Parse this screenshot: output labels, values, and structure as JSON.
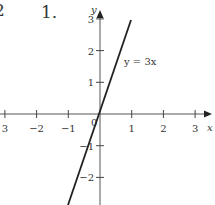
{
  "header": {
    "previous_problem_number": "2",
    "problem_number": "1."
  },
  "chart_data": {
    "type": "line",
    "title": "",
    "xlabel": "x",
    "ylabel": "y",
    "xlim": [
      -3,
      3
    ],
    "ylim": [
      -3,
      3
    ],
    "grid": false,
    "x_ticks": [
      -3,
      -2,
      -1,
      0,
      1,
      2,
      3
    ],
    "x_tick_labels": [
      "3",
      "−2",
      "−1",
      "0",
      "1",
      "2",
      "3"
    ],
    "y_ticks": [
      -2,
      -1,
      1,
      2,
      3
    ],
    "y_tick_labels": [
      "−2",
      "−1",
      "1",
      "2",
      "3"
    ],
    "series": [
      {
        "name": "y = 3x",
        "equation": "y = 3x",
        "x": [
          -1,
          1
        ],
        "y": [
          -3,
          3
        ]
      }
    ],
    "annotations": [
      {
        "text": "y = 3x",
        "x": 0.8,
        "y": 1.7
      }
    ],
    "origin_label": "0",
    "line_color": "#222222",
    "axis_color": "#555555"
  }
}
